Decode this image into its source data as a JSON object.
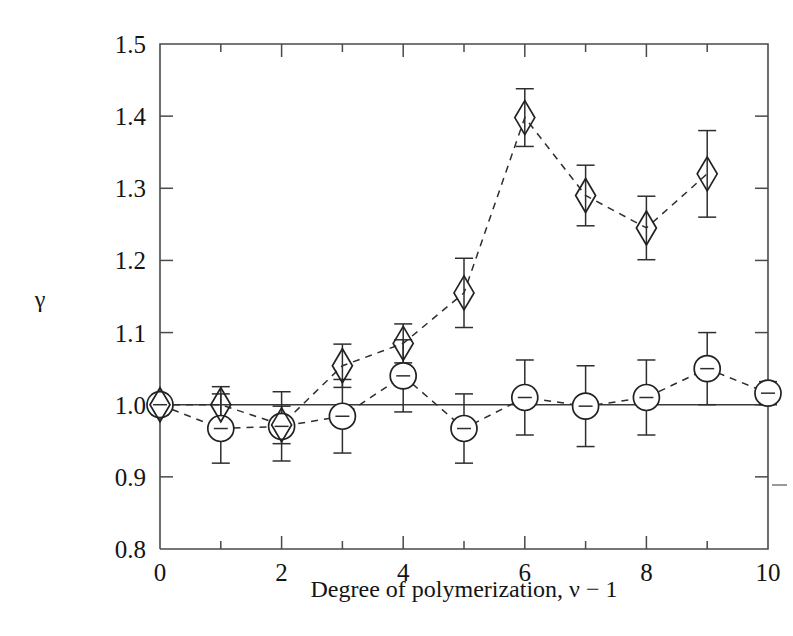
{
  "figure": {
    "background_color": "#ffffff",
    "frame_color": "#4a4a4a",
    "marker_color": "#222222"
  },
  "chart_data": {
    "type": "scatter",
    "title": "",
    "subtitle": "",
    "xlabel": "Degree of polymerization, ν − 1",
    "ylabel": "γ",
    "xlim": [
      0,
      10
    ],
    "ylim": [
      0.8,
      1.5
    ],
    "xticks": [
      0,
      1,
      2,
      3,
      4,
      5,
      6,
      7,
      8,
      9,
      10
    ],
    "xticklabels": [
      "0",
      "",
      "2",
      "",
      "4",
      "",
      "6",
      "",
      "8",
      "",
      "10"
    ],
    "yticks": [
      0.8,
      0.9,
      1.0,
      1.1,
      1.2,
      1.3,
      1.4,
      1.5
    ],
    "yticklabels": [
      "0.8",
      "0.9",
      "1.0",
      "1.1",
      "1.2",
      "1.3",
      "1.4",
      "1.5"
    ],
    "grid": false,
    "legend": false,
    "legend_position": "none",
    "reference_line": {
      "y": 1.0,
      "style": "solid"
    },
    "connector_style": "dashed",
    "series": [
      {
        "name": "circle-series",
        "marker": "circle",
        "x": [
          0,
          1,
          2,
          3,
          4,
          5,
          6,
          7,
          8,
          9,
          10
        ],
        "values": [
          1.0,
          0.967,
          0.97,
          0.984,
          1.04,
          0.967,
          1.01,
          0.998,
          1.01,
          1.05,
          1.016
        ],
        "yerr": [
          0.012,
          0.048,
          0.048,
          0.051,
          0.05,
          0.048,
          0.052,
          0.056,
          0.052,
          0.05,
          0.016
        ]
      },
      {
        "name": "diamond-series",
        "marker": "diamond",
        "x": [
          0,
          1,
          2,
          3,
          4,
          5,
          6,
          7,
          8,
          9
        ],
        "values": [
          1.0,
          1.0,
          0.972,
          1.054,
          1.085,
          1.155,
          1.398,
          1.29,
          1.245,
          1.32
        ],
        "yerr": [
          0.014,
          0.025,
          0.026,
          0.03,
          0.027,
          0.048,
          0.04,
          0.042,
          0.044,
          0.06
        ]
      }
    ]
  }
}
